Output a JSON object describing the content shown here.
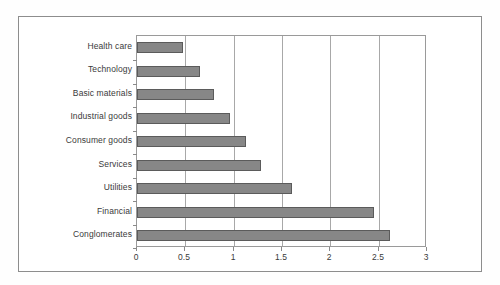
{
  "chart_data": {
    "type": "bar",
    "orientation": "horizontal",
    "title": "",
    "xlabel": "",
    "ylabel": "",
    "categories": [
      "Health care",
      "Technology",
      "Basic materials",
      "Industrial goods",
      "Consumer goods",
      "Services",
      "Utilities",
      "Financial",
      "Conglomerates"
    ],
    "values": [
      0.48,
      0.65,
      0.8,
      0.96,
      1.13,
      1.28,
      1.6,
      2.45,
      2.62
    ],
    "xlim": [
      0,
      3
    ],
    "xticks": [
      0,
      0.5,
      1,
      1.5,
      2,
      2.5,
      3
    ],
    "xticklabels": [
      "0",
      "0.5",
      "1",
      "1.5",
      "2",
      "2.5",
      "3"
    ],
    "grid": "vertical",
    "legend": null,
    "bar_color": "#878787",
    "bar_edge_color": "#5b5b5b",
    "plot_background": "#ffffff",
    "frame_color": "#8d8d8d"
  }
}
